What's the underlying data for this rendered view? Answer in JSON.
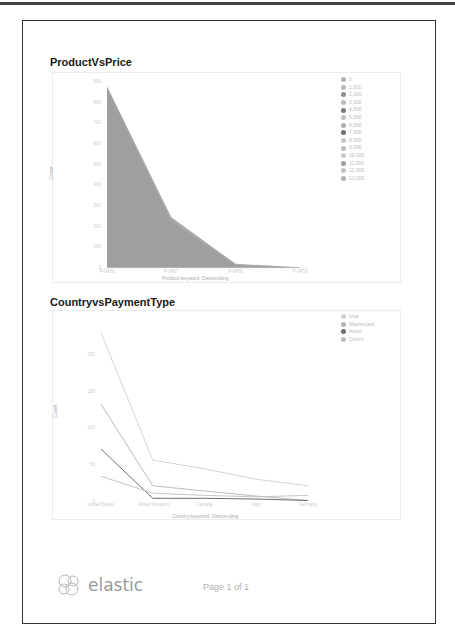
{
  "report": {
    "footer": {
      "logo_text": "elastic",
      "page_label": "Page 1 of 1"
    }
  },
  "chart_data": [
    {
      "type": "area",
      "title": "ProductVsPrice",
      "xlabel": "Product.keyword: Descending",
      "ylabel": "Count",
      "categories": [
        "P-0456",
        "P-0457",
        "P-0458",
        "P-0459"
      ],
      "series_stacked": true,
      "series": [
        {
          "name": "0",
          "values": [
            880,
            245,
            20,
            4
          ]
        },
        {
          "name": "1,000",
          "values": [
            0,
            0,
            0,
            0
          ]
        },
        {
          "name": "2,000",
          "values": [
            0,
            0,
            0,
            0
          ]
        }
      ],
      "ylim": [
        0,
        900
      ],
      "yticks": [
        "0",
        "100",
        "200",
        "300",
        "400",
        "500",
        "600",
        "700",
        "800",
        "900"
      ],
      "legend": [
        "0",
        "1,000",
        "2,000",
        "3,000",
        "4,000",
        "5,000",
        "6,000",
        "7,000",
        "8,000",
        "9,000",
        "10,000",
        "11,000",
        "12,000",
        "13,000"
      ],
      "legend_colors": [
        "#b3b3b3",
        "#b8b8b8",
        "#8f8f8f",
        "#bdbdbd",
        "#7a7a7a",
        "#c2c2c2",
        "#adadad",
        "#707070",
        "#c7c7c7",
        "#bababa",
        "#cccccc",
        "#9e9e9e",
        "#c4c4c4",
        "#b0b0b0"
      ],
      "legend_position": "right",
      "grid": false
    },
    {
      "type": "line",
      "title": "CountryvsPaymentType",
      "xlabel": "Country.keyword: Descending",
      "ylabel": "Count",
      "categories": [
        "United States",
        "United Kingdom",
        "Canada",
        "Italy",
        "Germany"
      ],
      "series": [
        {
          "name": "Visa",
          "values": [
            230,
            57,
            45,
            31,
            22
          ]
        },
        {
          "name": "Mastercard",
          "values": [
            133,
            22,
            15,
            8,
            2
          ]
        },
        {
          "name": "Amex",
          "values": [
            72,
            5,
            5,
            4,
            2
          ]
        },
        {
          "name": "Diners",
          "values": [
            35,
            12,
            9,
            7,
            9
          ]
        }
      ],
      "ylim": [
        0,
        250
      ],
      "yticks": [
        "0",
        "50",
        "100",
        "150",
        "200"
      ],
      "legend": [
        "Visa",
        "Mastercard",
        "Amex",
        "Diners"
      ],
      "legend_colors": [
        "#d0d0d0",
        "#b4b4b4",
        "#6e6e6e",
        "#bfbfbf"
      ],
      "legend_position": "right",
      "grid": false
    }
  ]
}
